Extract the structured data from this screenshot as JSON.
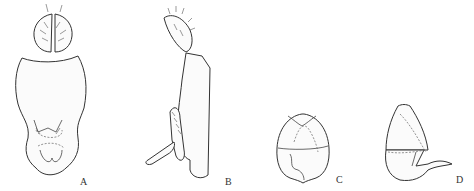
{
  "figure": {
    "panels": [
      {
        "id": "A",
        "label": "A",
        "view": "dorsal/ventral view with cerci"
      },
      {
        "id": "B",
        "label": "B",
        "view": "lateral view"
      },
      {
        "id": "C",
        "label": "C",
        "view": "structure front view"
      },
      {
        "id": "D",
        "label": "D",
        "view": "structure lateral view"
      }
    ]
  }
}
